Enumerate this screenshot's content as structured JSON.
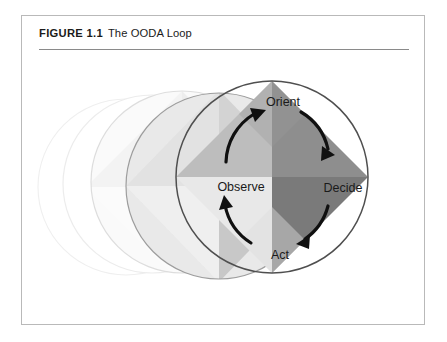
{
  "figure": {
    "label": "FIGURE 1.1",
    "title": "The OODA Loop",
    "frame_border_color": "#b9b9b9",
    "rule_color": "#8a8a8a",
    "background": "#ffffff"
  },
  "diagram": {
    "type": "cycle",
    "stage_labels": [
      "Observe",
      "Orient",
      "Decide",
      "Act"
    ],
    "arrow_color": "#101010",
    "arrow_direction": "clockwise-through-observe-orient-decide-act",
    "circles": [
      {
        "name": "ghost-outline-far",
        "visible_text": "",
        "center_x": 104,
        "center_y": 171,
        "radius": 88,
        "outline_color": "#f0f0f0",
        "opacity": 0.35,
        "filled": false
      },
      {
        "name": "ghost-outline-near",
        "visible_text": "",
        "center_x": 130,
        "center_y": 168,
        "radius": 89,
        "outline_color": "#ededed",
        "opacity": 0.5,
        "filled": false
      },
      {
        "name": "ghost-light",
        "visible_text": "Obs",
        "center_x": 160,
        "center_y": 166,
        "radius": 91,
        "outline_color": "#dcdcdc",
        "opacity": 1,
        "filled": true,
        "label_color": "#c2c2c2",
        "quadrants": {
          "top": "#eeeeee",
          "right": "#e6e6e6",
          "bottom": "#fafafa",
          "left": "#f4f4f4"
        }
      },
      {
        "name": "ghost-medium",
        "visible_text": "Obs",
        "center_x": 197,
        "center_y": 170,
        "radius": 93,
        "outline_color": "#9a9a9a",
        "opacity": 1,
        "filled": true,
        "label_color": "#8d8d8d",
        "quadrants": {
          "top": "#d2d2d2",
          "right": "#c6c6c6",
          "bottom": "#efefef",
          "left": "#e4e4e4"
        }
      },
      {
        "name": "main-circle",
        "visible_text": "Observe",
        "center_x": 250,
        "center_y": 161,
        "radius": 96,
        "outline_color": "#555555",
        "opacity": 1,
        "filled": true,
        "label_color": "#1a1a1a",
        "quadrants": {
          "top": "#8e8e8e",
          "right": "#7a7a7a",
          "bottom": "#e8e8e8",
          "left": "#bdbdbd"
        }
      }
    ],
    "main_labels": {
      "observe": "Observe",
      "orient": "Orient",
      "decide": "Decide",
      "act": "Act"
    },
    "ghost_label_text": "Obs"
  }
}
